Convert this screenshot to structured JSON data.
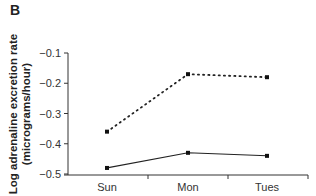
{
  "panel_label": "B",
  "chart_data": {
    "type": "line",
    "title": "",
    "xlabel": "",
    "ylabel": "Log adrenaline excretion rate (micrograms/hour)",
    "ylabel_line1": "Log adrenaline excretion rate",
    "ylabel_line2": "(micrograms/hour)",
    "categories": [
      "Sun",
      "Mon",
      "Tues"
    ],
    "ylim": [
      -0.5,
      -0.1
    ],
    "yticks": [
      "-0.1",
      "-0.2",
      "-0.3",
      "-0.4",
      "-0.5"
    ],
    "grid": false,
    "legend": "none",
    "series": [
      {
        "name": "dotted",
        "style": "dotted",
        "values": [
          -0.36,
          -0.17,
          -0.18
        ]
      },
      {
        "name": "solid",
        "style": "solid",
        "values": [
          -0.48,
          -0.43,
          -0.44
        ]
      }
    ]
  }
}
